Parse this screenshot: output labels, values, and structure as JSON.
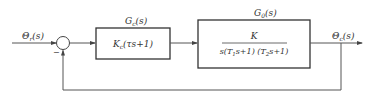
{
  "diagram": {
    "type": "control-block-diagram",
    "input_signal": {
      "symbol": "Θ",
      "sub": "r",
      "arg": "(s)"
    },
    "output_signal": {
      "symbol": "Θ",
      "sub": "c",
      "arg": "(s)"
    },
    "summing_junction": {
      "feedback_sign": "−"
    },
    "controller": {
      "label": {
        "symbol": "G",
        "sub": "c",
        "arg": "(s)"
      },
      "transfer_function": {
        "gain": "K",
        "gain_sub": "c",
        "rest": "(τs+1)"
      }
    },
    "plant": {
      "label": {
        "symbol": "G",
        "sub": "0",
        "arg": "(s)"
      },
      "numerator": "K",
      "denominator": {
        "p1": "s(T",
        "s1": "1",
        "p2": "s+1) (T",
        "s2": "2",
        "p3": "s+1)"
      }
    },
    "feedback": "unity"
  },
  "colors": {
    "line": "#555555",
    "box": "#333333",
    "text": "#333333"
  }
}
